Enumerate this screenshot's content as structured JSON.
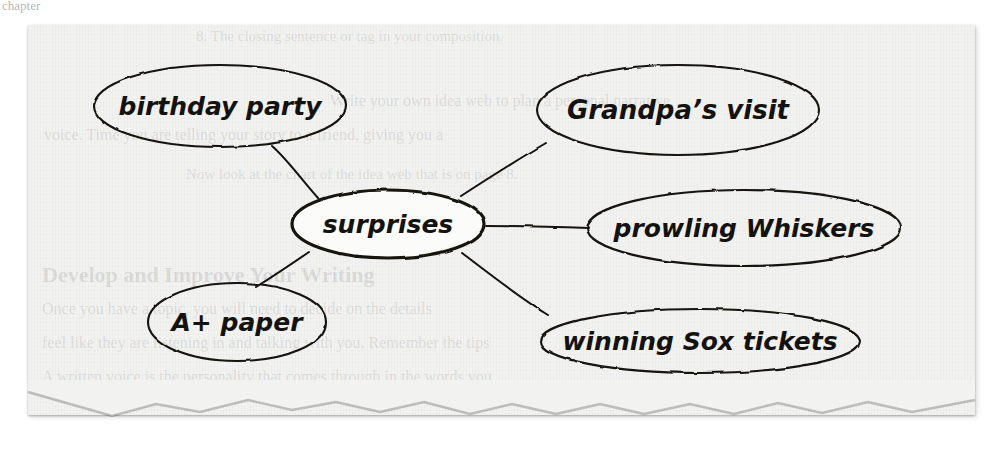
{
  "page": {
    "paper_color": "#f2f2f0",
    "ink_color": "#14120f"
  },
  "bleed_text": {
    "top_partial": "chapter",
    "line_1": "8. The closing sentence or tag in your composition.",
    "line_2": "Write your own idea web to plan a personal narrative.",
    "line_3": "voice. Time you are telling your story to a friend, giving you a",
    "line_4": "Now look at the chart of the idea web that is on page 8.",
    "line_5": "Develop and Improve Your Writing",
    "line_6": "Once you have a topic, you will need to decide on the details",
    "line_7": "feel like they are listening in and talking with you. Remember the tips",
    "line_8": "A written voice is the personality that comes through in the words you"
  },
  "diagram": {
    "type": "idea-web",
    "center_node": {
      "id": "center",
      "label": "surprises",
      "cx": 388,
      "cy": 224,
      "rx": 96,
      "ry": 34,
      "stroke_width": 3.2,
      "font_size": 25
    },
    "nodes": [
      {
        "id": "birthday-party",
        "label": "birthday party",
        "cx": 220,
        "cy": 106,
        "rx": 126,
        "ry": 41,
        "stroke_width": 2.1,
        "font_size": 25
      },
      {
        "id": "grandpas-visit",
        "label": "Grandpa’s visit",
        "cx": 678,
        "cy": 110,
        "rx": 141,
        "ry": 45,
        "stroke_width": 2.1,
        "font_size": 26
      },
      {
        "id": "prowling-whiskers",
        "label": "prowling Whiskers",
        "cx": 744,
        "cy": 228,
        "rx": 157,
        "ry": 38,
        "stroke_width": 2.1,
        "font_size": 25
      },
      {
        "id": "winning-sox-tickets",
        "label": "winning Sox tickets",
        "cx": 700,
        "cy": 341,
        "rx": 160,
        "ry": 32,
        "stroke_width": 2.1,
        "font_size": 25
      },
      {
        "id": "a-plus-paper",
        "label": "A+ paper",
        "cx": 237,
        "cy": 322,
        "rx": 89,
        "ry": 39,
        "stroke_width": 2.1,
        "font_size": 25
      }
    ],
    "edges": [
      {
        "id": "edge-center-birthday-party",
        "from": "center",
        "to": "birthday-party",
        "path": "M 318 198 C 300 178 288 160 272 146"
      },
      {
        "id": "edge-center-grandpas-visit",
        "from": "center",
        "to": "grandpas-visit",
        "path": "M 461 196 C 492 176 520 158 546 143"
      },
      {
        "id": "edge-center-prowling-whiskers",
        "from": "center",
        "to": "prowling-whiskers",
        "path": "M 486 226 C 520 226 560 227 589 228"
      },
      {
        "id": "edge-center-winning-sox",
        "from": "center",
        "to": "winning-sox-tickets",
        "path": "M 462 253 C 495 278 520 298 548 315"
      },
      {
        "id": "edge-center-a-plus-paper",
        "from": "center",
        "to": "a-plus-paper",
        "path": "M 309 252 C 290 265 272 277 256 287"
      }
    ]
  }
}
